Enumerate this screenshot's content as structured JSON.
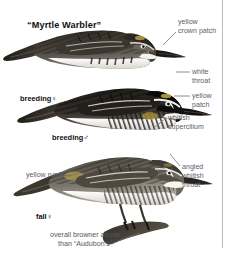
{
  "plate": {
    "title": "“Myrtle Warbler”",
    "background_color": "#ffffff",
    "rule_color": "#b9bcc4",
    "text_color": "#111111",
    "callout_color": "#5d6068",
    "leader_color": "#7e818a"
  },
  "specimens": [
    {
      "id": "breeding-female",
      "label": "breeding",
      "symbol": "♀"
    },
    {
      "id": "breeding-male",
      "label": "breeding",
      "symbol": "♂"
    },
    {
      "id": "fall-female",
      "label": "fall",
      "symbol": "♀"
    }
  ],
  "callouts": [
    {
      "id": "yellow-crown-patch",
      "line1": "yellow",
      "line2": "crown patch"
    },
    {
      "id": "white-throat",
      "line1": "white",
      "line2": "throat"
    },
    {
      "id": "yellow-patch",
      "line1": "yellow",
      "line2": "patch"
    },
    {
      "id": "whitish-supercilium",
      "line1": "whitish",
      "line2": "supercilium"
    },
    {
      "id": "angled-whitish-throat",
      "line1": "angled",
      "line2": "whitish",
      "line3": "throat"
    },
    {
      "id": "yellow-rump",
      "line1": "yellow rump—"
    }
  ],
  "caption": {
    "line1": "overall browner above",
    "line2": "than “Audubon’s”"
  }
}
